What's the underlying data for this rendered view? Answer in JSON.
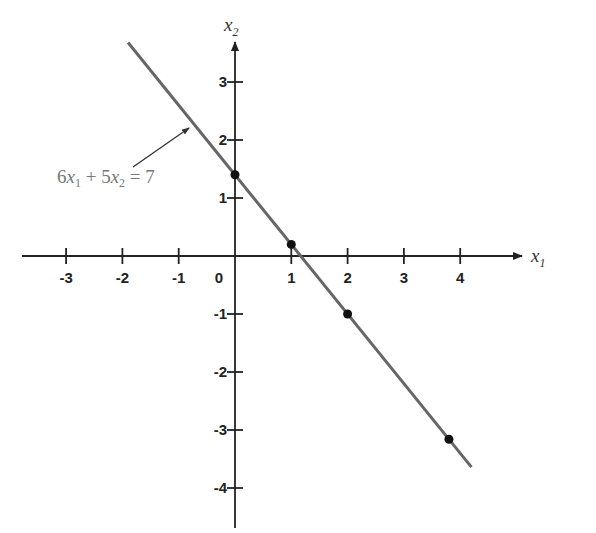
{
  "chart_data": {
    "type": "line",
    "title": "",
    "xlabel": "x1",
    "ylabel": "x2",
    "xlim": [
      -3.3,
      4.7
    ],
    "ylim": [
      -4.7,
      3.8
    ],
    "grid": false,
    "x_ticks": [
      -3,
      -2,
      -1,
      0,
      1,
      2,
      3,
      4
    ],
    "y_ticks": [
      -4,
      -3,
      -2,
      -1,
      1,
      2,
      3
    ],
    "line": {
      "equation": "6x1 + 5x2 = 7",
      "x_start": -1.9,
      "y_start": 3.68,
      "x_end": 4.2,
      "y_end": -3.64,
      "color": "#666666"
    },
    "points": [
      {
        "x": 0,
        "y": 1.4
      },
      {
        "x": 1,
        "y": 0.2
      },
      {
        "x": 2,
        "y": -1
      },
      {
        "x": 3.8,
        "y": -3.16
      }
    ],
    "annotation": {
      "text": "6x1 + 5x2 = 7",
      "arrow_to": {
        "x": -0.8,
        "y": 2.37
      }
    }
  },
  "labels": {
    "x_axis_var": "x",
    "x_axis_sub": "1",
    "y_axis_var": "x",
    "y_axis_sub": "2",
    "origin": "0",
    "eq_parts": {
      "c1": "6",
      "v1": "x",
      "s1": "1",
      "plus": " + 5",
      "v2": "x",
      "s2": "2",
      "rhs": " = 7"
    }
  }
}
